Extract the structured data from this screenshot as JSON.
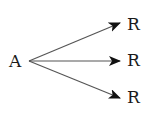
{
  "diagram": {
    "source": {
      "label": "A"
    },
    "targets": [
      {
        "label": "R"
      },
      {
        "label": "R"
      },
      {
        "label": "R"
      }
    ],
    "edge_color": "#555555",
    "arrowhead_color": "#111111"
  }
}
